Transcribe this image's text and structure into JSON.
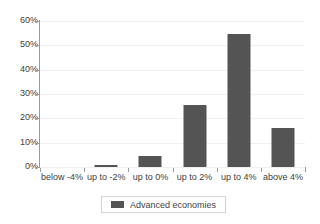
{
  "chart_data": {
    "type": "bar",
    "title": "",
    "subtitle": "",
    "xlabel": "",
    "ylabel": "",
    "categories": [
      "below -4%",
      "up to -2%",
      "up to 0%",
      "up to 2%",
      "up to 4%",
      "above 4%"
    ],
    "series": [
      {
        "name": "Advanced economies",
        "color": "#545454",
        "values": [
          0,
          0.7,
          4.7,
          25.5,
          54.5,
          16
        ]
      }
    ],
    "ylim": [
      0,
      60
    ],
    "ytick_values": [
      0,
      10,
      20,
      30,
      40,
      50,
      60
    ],
    "ytick_labels": [
      "0%",
      "10%",
      "20%",
      "30%",
      "40%",
      "50%",
      "60%"
    ],
    "grid": true,
    "grid_axis": "y",
    "grid_color": "#f0f0f0",
    "axis_color": "#9a9a9a",
    "legend": {
      "position": "bottom",
      "entries": [
        {
          "label": "Advanced economies",
          "color": "#545454",
          "swatch_icon": "legend-swatch-square"
        }
      ]
    },
    "annotations": []
  }
}
